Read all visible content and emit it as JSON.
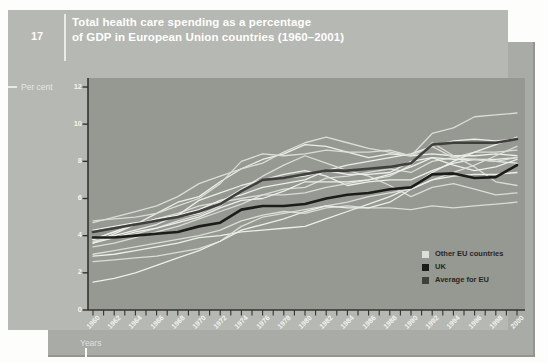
{
  "figure": {
    "number": "17",
    "title_line1": "Total health care spending as a percentage",
    "title_line2": "of GDP in European Union countries (1960–2001)"
  },
  "axes": {
    "y_label": "Per cent",
    "x_label": "Years",
    "y_ticks": [
      12,
      10,
      8,
      6,
      4,
      2,
      0
    ]
  },
  "legend": [
    {
      "label": "Other EU countries",
      "color": "#dcdeda"
    },
    {
      "label": "UK",
      "color": "#1c1d1b"
    },
    {
      "label": "Average for EU",
      "color": "#3f403b"
    }
  ],
  "colors": {
    "card": "#b6b8b3",
    "card_shadow": "#a9aba6",
    "plot_background": "#969892",
    "axis": "#33342f",
    "tick_label": "#f2f4ef",
    "title_text": "#ffffff"
  },
  "chart_data": {
    "type": "line",
    "title": "Total health care spending as a percentage of GDP in European Union countries (1960–2001)",
    "xlabel": "Years",
    "ylabel": "Per cent",
    "xlim": [
      1960,
      2001
    ],
    "ylim": [
      0,
      12
    ],
    "grid": false,
    "legend_position": "inside lower right",
    "x": [
      1960,
      1962,
      1964,
      1966,
      1968,
      1970,
      1972,
      1974,
      1976,
      1978,
      1980,
      1982,
      1984,
      1986,
      1988,
      1990,
      1992,
      1994,
      1996,
      1998,
      2000
    ],
    "line_colors": {
      "other": "#eceee8",
      "other_alt": "#dadcd6",
      "uk": "#1c1d1b",
      "average": "#3f403b"
    },
    "line_widths": {
      "other": 1.3,
      "uk": 2.6,
      "average": 2.6
    },
    "series": [
      {
        "name": "Austria",
        "role": "other",
        "values": [
          4.3,
          4.5,
          4.7,
          4.8,
          5.0,
          5.2,
          5.8,
          6.5,
          7.0,
          7.3,
          7.5,
          7.2,
          6.7,
          6.9,
          7.0,
          7.0,
          7.5,
          7.9,
          8.1,
          8.0,
          7.9
        ]
      },
      {
        "name": "Belgium",
        "role": "other",
        "values": [
          3.4,
          3.6,
          3.9,
          4.2,
          4.5,
          4.9,
          5.3,
          5.7,
          6.2,
          6.5,
          6.6,
          7.1,
          7.2,
          7.4,
          7.6,
          7.4,
          8.0,
          8.2,
          8.5,
          8.5,
          8.6
        ]
      },
      {
        "name": "Denmark",
        "role": "other",
        "values": [
          3.6,
          4.1,
          4.6,
          5.2,
          5.8,
          6.1,
          6.9,
          7.6,
          8.1,
          8.4,
          8.9,
          8.8,
          8.5,
          8.2,
          8.4,
          8.3,
          8.4,
          8.3,
          8.3,
          8.4,
          8.3
        ]
      },
      {
        "name": "Finland",
        "role": "other",
        "values": [
          3.8,
          4.2,
          4.6,
          4.9,
          5.2,
          5.6,
          5.8,
          6.0,
          6.2,
          6.2,
          6.3,
          6.6,
          6.8,
          7.0,
          7.2,
          7.8,
          9.0,
          8.3,
          7.7,
          6.9,
          6.7
        ]
      },
      {
        "name": "France",
        "role": "other",
        "values": [
          3.8,
          4.2,
          4.6,
          4.9,
          5.1,
          5.4,
          5.9,
          6.2,
          6.6,
          6.8,
          7.0,
          7.5,
          7.8,
          8.0,
          8.2,
          8.4,
          8.8,
          9.1,
          9.2,
          9.1,
          9.2
        ]
      },
      {
        "name": "Germany",
        "role": "other",
        "values": [
          4.8,
          4.9,
          5.0,
          5.2,
          5.6,
          6.0,
          6.8,
          8.0,
          8.4,
          8.3,
          8.4,
          8.6,
          8.5,
          8.5,
          8.6,
          8.3,
          9.5,
          9.8,
          10.4,
          10.5,
          10.6
        ]
      },
      {
        "name": "Greece",
        "role": "other",
        "values": [
          2.9,
          3.0,
          3.2,
          3.4,
          3.6,
          3.9,
          4.0,
          4.2,
          4.3,
          4.4,
          4.5,
          4.9,
          5.3,
          5.7,
          6.1,
          6.6,
          7.4,
          8.0,
          8.5,
          8.9,
          9.3
        ]
      },
      {
        "name": "Ireland",
        "role": "other",
        "values": [
          3.7,
          3.9,
          4.1,
          4.4,
          4.8,
          5.1,
          5.6,
          6.5,
          7.2,
          7.8,
          8.3,
          7.9,
          7.5,
          7.2,
          6.7,
          6.1,
          6.6,
          6.8,
          6.5,
          6.2,
          6.3
        ]
      },
      {
        "name": "Italy",
        "role": "other",
        "values": [
          3.6,
          3.9,
          4.2,
          4.4,
          4.7,
          5.0,
          5.5,
          5.9,
          6.0,
          6.4,
          6.9,
          6.9,
          6.9,
          7.0,
          7.3,
          7.7,
          8.2,
          7.8,
          7.5,
          7.7,
          8.1
        ]
      },
      {
        "name": "Luxembourg",
        "role": "other",
        "values": [
          3.0,
          3.2,
          3.4,
          3.6,
          3.8,
          4.0,
          4.3,
          4.8,
          5.1,
          5.3,
          5.2,
          5.5,
          5.6,
          5.5,
          5.5,
          5.4,
          5.6,
          5.5,
          5.6,
          5.7,
          5.8
        ]
      },
      {
        "name": "Netherlands",
        "role": "other",
        "values": [
          3.8,
          4.0,
          4.3,
          4.6,
          5.1,
          5.9,
          6.3,
          6.7,
          7.0,
          7.1,
          7.2,
          7.5,
          7.3,
          7.3,
          7.4,
          8.0,
          8.2,
          8.1,
          8.1,
          8.1,
          8.2
        ]
      },
      {
        "name": "Portugal",
        "role": "other",
        "values": [
          2.6,
          2.7,
          2.8,
          2.9,
          3.1,
          3.3,
          3.7,
          4.5,
          5.0,
          5.2,
          5.4,
          5.6,
          5.8,
          6.1,
          6.3,
          6.5,
          7.0,
          7.4,
          7.8,
          8.3,
          8.8
        ]
      },
      {
        "name": "Spain",
        "role": "other",
        "values": [
          1.5,
          1.7,
          2.0,
          2.4,
          2.8,
          3.2,
          3.7,
          4.3,
          4.6,
          4.9,
          5.3,
          5.6,
          5.5,
          5.5,
          5.8,
          6.5,
          7.0,
          7.2,
          7.3,
          7.3,
          7.4
        ]
      },
      {
        "name": "Sweden",
        "role": "other",
        "values": [
          4.7,
          5.0,
          5.3,
          5.6,
          6.1,
          6.8,
          7.2,
          7.6,
          7.9,
          8.5,
          9.0,
          9.3,
          9.0,
          8.7,
          8.5,
          8.3,
          8.8,
          8.2,
          8.1,
          8.0,
          8.2
        ]
      },
      {
        "name": "Average for EU",
        "role": "average",
        "values": [
          4.2,
          4.4,
          4.6,
          4.8,
          5.0,
          5.3,
          5.7,
          6.4,
          7.0,
          7.1,
          7.3,
          7.5,
          7.5,
          7.6,
          7.7,
          7.9,
          8.9,
          9.0,
          9.0,
          9.0,
          9.2
        ]
      },
      {
        "name": "UK",
        "role": "uk",
        "values": [
          3.9,
          3.9,
          4.0,
          4.1,
          4.2,
          4.5,
          4.7,
          5.4,
          5.6,
          5.6,
          5.7,
          6.0,
          6.2,
          6.3,
          6.5,
          6.6,
          7.3,
          7.35,
          7.1,
          7.15,
          7.8
        ]
      }
    ]
  }
}
